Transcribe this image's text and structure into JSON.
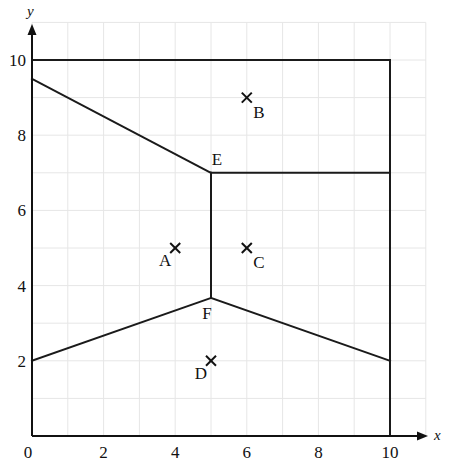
{
  "chart_data": {
    "type": "diagram",
    "title": "",
    "xlabel": "x",
    "ylabel": "y",
    "xlim": [
      0,
      11
    ],
    "ylim": [
      0,
      11
    ],
    "grid": true,
    "x_ticks": [
      0,
      2,
      4,
      6,
      8,
      10
    ],
    "y_ticks": [
      2,
      4,
      6,
      8,
      10
    ],
    "origin_label": "0",
    "points": [
      {
        "label": "A",
        "x": 4,
        "y": 5,
        "marker": "cross",
        "label_pos": "below-left"
      },
      {
        "label": "B",
        "x": 6,
        "y": 9,
        "marker": "cross",
        "label_pos": "below-right"
      },
      {
        "label": "C",
        "x": 6,
        "y": 5,
        "marker": "cross",
        "label_pos": "below-right"
      },
      {
        "label": "D",
        "x": 5,
        "y": 2,
        "marker": "cross",
        "label_pos": "below-left"
      }
    ],
    "vertices": [
      {
        "label": "E",
        "x": 5,
        "y": 7,
        "label_pos": "above"
      },
      {
        "label": "F",
        "x": 5,
        "y": 3.67,
        "label_pos": "below"
      }
    ],
    "boundary": [
      [
        0,
        10
      ],
      [
        10,
        10
      ],
      [
        10,
        0
      ]
    ],
    "segments": [
      {
        "from": [
          0,
          9.5
        ],
        "to": [
          5,
          7
        ]
      },
      {
        "from": [
          5,
          7
        ],
        "to": [
          10,
          7
        ]
      },
      {
        "from": [
          5,
          7
        ],
        "to": [
          5,
          3.67
        ]
      },
      {
        "from": [
          0,
          2
        ],
        "to": [
          5,
          3.67
        ]
      },
      {
        "from": [
          5,
          3.67
        ],
        "to": [
          10,
          2
        ]
      }
    ]
  },
  "layout": {
    "origin_px": [
      32,
      436
    ],
    "unit_x_px": 35.8,
    "unit_y_px": 37.6,
    "x_axis_end_px": 428,
    "y_axis_end_px": 24
  }
}
